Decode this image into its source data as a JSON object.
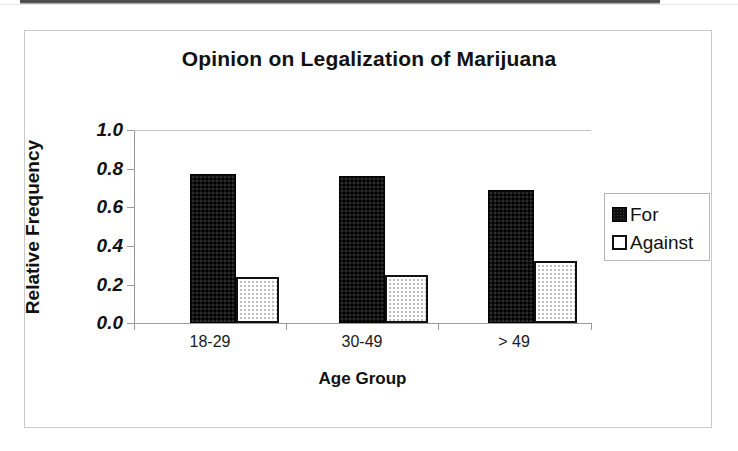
{
  "chart_data": {
    "type": "bar",
    "title": "Opinion on Legalization of Marijuana",
    "xlabel": "Age Group",
    "ylabel": "Relative Frequency",
    "categories": [
      "18-29",
      "30-49",
      "> 49"
    ],
    "series": [
      {
        "name": "For",
        "values": [
          0.77,
          0.76,
          0.69
        ],
        "color": "#111111"
      },
      {
        "name": "Against",
        "values": [
          0.24,
          0.25,
          0.32
        ],
        "color": "#ffffff"
      }
    ],
    "ylim": [
      0.0,
      1.0
    ],
    "ytick_labels": [
      "1.0",
      "0.8",
      "0.6",
      "0.4",
      "0.2",
      "0.0"
    ],
    "ytick_values": [
      1.0,
      0.8,
      0.6,
      0.4,
      0.2,
      0.0
    ],
    "grid": false,
    "legend_position": "right"
  },
  "legend": {
    "items": [
      {
        "label": "For",
        "swatch": "filled-black-square-icon"
      },
      {
        "label": "Against",
        "swatch": "outlined-white-square-icon"
      }
    ]
  }
}
